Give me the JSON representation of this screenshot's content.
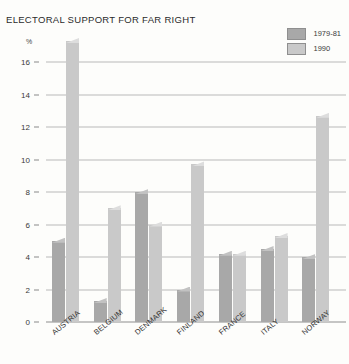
{
  "chart_data": {
    "type": "bar",
    "title": "ELECTORAL SUPPORT FOR FAR RIGHT",
    "xlabel": "",
    "ylabel": "%",
    "ylim": [
      0,
      18
    ],
    "yticks": [
      0,
      2,
      4,
      6,
      8,
      10,
      12,
      14,
      16
    ],
    "grid": true,
    "legend_position": "top-right",
    "categories": [
      "AUSTRIA",
      "BELGIUM",
      "DENMARK",
      "FINLAND",
      "FRANCE",
      "ITALY",
      "NORWAY"
    ],
    "series": [
      {
        "name": "1979-81",
        "color": "#a8a8a8",
        "values": [
          5.0,
          1.3,
          8.0,
          2.0,
          4.2,
          4.5,
          4.0
        ]
      },
      {
        "name": "1990",
        "color": "#c9c9c9",
        "values": [
          17.3,
          7.0,
          6.0,
          9.7,
          4.2,
          5.3,
          12.7
        ]
      }
    ]
  },
  "legend": {
    "items": [
      {
        "label": "1979-81",
        "color": "#a8a8a8"
      },
      {
        "label": "1990",
        "color": "#c9c9c9"
      }
    ]
  }
}
